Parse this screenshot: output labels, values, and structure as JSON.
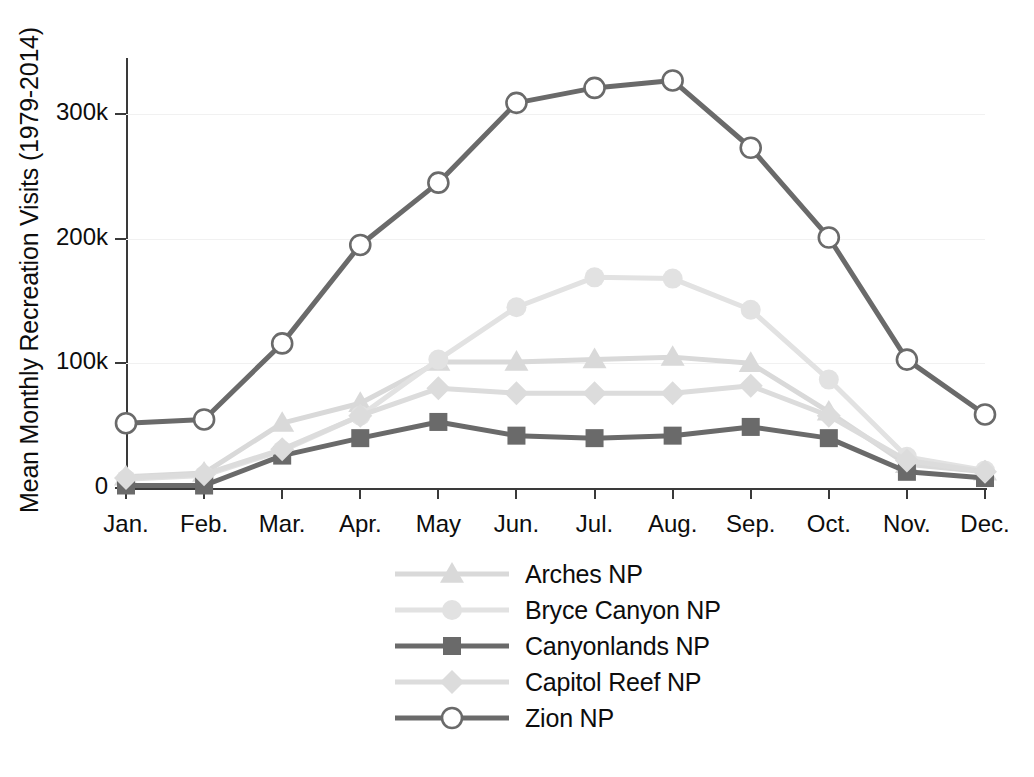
{
  "chart_data": {
    "type": "line",
    "title": "",
    "xlabel": "",
    "ylabel": "Mean Monthly Recreation Visits (1979-2014)",
    "categories": [
      "Jan.",
      "Feb.",
      "Mar.",
      "Apr.",
      "May",
      "Jun.",
      "Jul.",
      "Aug.",
      "Sep.",
      "Oct.",
      "Nov.",
      "Dec."
    ],
    "ytick_values": [
      0,
      100000,
      200000,
      300000
    ],
    "ytick_labels": [
      "0",
      "100k",
      "200k",
      "300k"
    ],
    "ylim": [
      0,
      345000
    ],
    "grid": true,
    "legend_position": "bottom-center",
    "series": [
      {
        "name": "Arches NP",
        "marker": "triangle",
        "color": "#d9d9d9",
        "values": [
          9000,
          12000,
          52000,
          68000,
          101000,
          101000,
          103000,
          105000,
          100000,
          61000,
          19000,
          13000
        ]
      },
      {
        "name": "Bryce Canyon NP",
        "marker": "circle",
        "color": "#e2e2e2",
        "values": [
          7000,
          10000,
          30000,
          58000,
          103000,
          145000,
          169000,
          168000,
          143000,
          87000,
          25000,
          14000
        ]
      },
      {
        "name": "Canyonlands NP",
        "marker": "square",
        "color": "#6a6a6a",
        "values": [
          2000,
          2000,
          26000,
          40000,
          53000,
          42000,
          40000,
          42000,
          49000,
          40000,
          13000,
          8000
        ]
      },
      {
        "name": "Capitol Reef NP",
        "marker": "diamond",
        "color": "#dcdcdc",
        "values": [
          8000,
          11000,
          31000,
          58000,
          80000,
          76000,
          76000,
          76000,
          82000,
          58000,
          22000,
          13000
        ]
      },
      {
        "name": "Zion NP",
        "marker": "open-circle",
        "color": "#6a6a6a",
        "values": [
          52000,
          55000,
          116000,
          195000,
          245000,
          309000,
          321000,
          327000,
          273000,
          201000,
          103000,
          59000
        ]
      }
    ]
  },
  "legend": {
    "items": [
      {
        "label": "Arches NP"
      },
      {
        "label": "Bryce Canyon NP"
      },
      {
        "label": "Canyonlands NP"
      },
      {
        "label": "Capitol Reef NP"
      },
      {
        "label": "Zion NP"
      }
    ]
  },
  "colors": {
    "axis": "#3a3a3a",
    "grid": "#f1f1f1",
    "text": "#0d0d0d",
    "dark_series": "#6a6a6a",
    "light_series": "#dcdcdc",
    "background": "#ffffff"
  }
}
